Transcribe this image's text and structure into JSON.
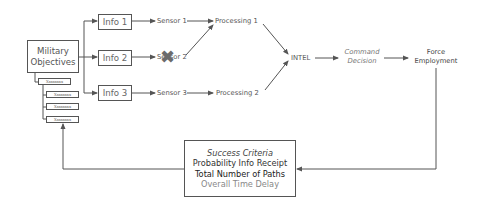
{
  "diagram": {
    "objectives": {
      "label_line1": "Military",
      "label_line2": "Objectives",
      "sub_items": [
        "Xxxxxxxx",
        "Xxxxxxxx",
        "Xxxxxxxx",
        "Xxxxxxxx"
      ]
    },
    "info_nodes": [
      "Info 1",
      "Info 2",
      "Info 3"
    ],
    "sensors": [
      "Sensor 1",
      "Sensor 2",
      "Sensor 3"
    ],
    "failed_sensor_mark": "✖",
    "processing": [
      "Processing 1",
      "Processing 2"
    ],
    "intel": "INTEL",
    "command_decision": {
      "line1": "Command",
      "line2": "Decision"
    },
    "force_employment": {
      "line1": "Force",
      "line2": "Employment"
    },
    "success_criteria": {
      "title": "Success Criteria",
      "items": [
        "Probability Info Receipt",
        "Total Number of Paths",
        "Overall Time Delay"
      ]
    },
    "colors": {
      "line": "#555555",
      "failed_mark": "#6b6b6b",
      "muted_text": "#888888"
    }
  }
}
